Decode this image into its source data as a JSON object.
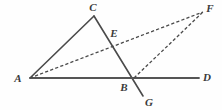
{
  "figure": {
    "type": "geometry-diagram",
    "width": 222,
    "height": 110,
    "background_color": "#fefefe",
    "stroke_color": "#4a4a4a",
    "label_color": "#3a3a3a"
  },
  "points": {
    "A": {
      "label": "A",
      "x": 30,
      "y": 78,
      "label_x": 18,
      "label_y": 78
    },
    "B": {
      "label": "B",
      "x": 134,
      "y": 78,
      "label_x": 124,
      "label_y": 87
    },
    "C": {
      "label": "C",
      "x": 94,
      "y": 16,
      "label_x": 93,
      "label_y": 7
    },
    "D": {
      "label": "D",
      "x": 199,
      "y": 78,
      "label_x": 207,
      "label_y": 77
    },
    "E": {
      "label": "E",
      "x": 111,
      "y": 40,
      "label_x": 114,
      "label_y": 33
    },
    "F": {
      "label": "F",
      "x": 203,
      "y": 12,
      "label_x": 210,
      "label_y": 8
    },
    "G": {
      "label": "G",
      "x": 143,
      "y": 96,
      "label_x": 149,
      "label_y": 102
    }
  },
  "segments": [
    {
      "name": "segment-AC",
      "from": "A",
      "to": "C",
      "style": "solid"
    },
    {
      "name": "segment-CG",
      "from": "C",
      "to": "G",
      "style": "solid"
    },
    {
      "name": "segment-AD",
      "from": "A",
      "to": "D",
      "style": "solid"
    },
    {
      "name": "segment-AF",
      "from": "A",
      "to": "F",
      "style": "dashed"
    },
    {
      "name": "segment-BF",
      "from": "B",
      "to": "F",
      "style": "dashed"
    }
  ]
}
